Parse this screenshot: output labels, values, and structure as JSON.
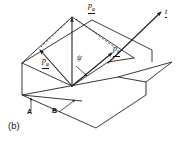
{
  "figure": {
    "caption": "(b)",
    "background_color": "#ffffff",
    "line_color": "#222222",
    "text_color": "#111111",
    "width": 188,
    "height": 143
  },
  "labels": {
    "p_phi_top": {
      "symbol": "p",
      "subscript": "φ",
      "underlined": true
    },
    "p_phi_left": {
      "symbol": "p",
      "subscript": "φ",
      "underlined": true
    },
    "p_theta": {
      "symbol": "p",
      "subscript": "θ",
      "underlined": true
    },
    "t_vector": {
      "symbol": "t",
      "underlined": true
    },
    "psi_angle": {
      "symbol": "ψ"
    },
    "plane_a": {
      "symbol": "A"
    },
    "plane_b": {
      "symbol": "B"
    }
  },
  "geometry": {
    "planes": [
      {
        "name": "tilted-plane-upper",
        "points": "22,63 92,20 152,50 82,93"
      },
      {
        "name": "horizontal-plane-lower",
        "points": "22,95 118,77 172,62 96,128"
      }
    ],
    "vectors": [
      {
        "name": "vertical-momentum-vector",
        "from": [
          72,
          86
        ],
        "to": [
          72,
          17
        ]
      },
      {
        "name": "t-direction-vector",
        "from": [
          108,
          62
        ],
        "to": [
          160,
          12
        ]
      },
      {
        "name": "p-phi-left-vector",
        "from": [
          72,
          86
        ],
        "to": [
          39,
          51
        ]
      },
      {
        "name": "p-theta-vector",
        "from": [
          72,
          86
        ],
        "to": [
          114,
          52
        ]
      },
      {
        "name": "psi-small-arrow",
        "from": [
          76,
          66
        ],
        "to": [
          86,
          75
        ]
      }
    ],
    "dashed_lines": [
      {
        "name": "dashed-upper-right",
        "from": [
          76,
          18
        ],
        "to": [
          113,
          48
        ]
      },
      {
        "name": "dashed-upper-left",
        "from": [
          70,
          20
        ],
        "to": [
          40,
          47
        ]
      }
    ]
  }
}
